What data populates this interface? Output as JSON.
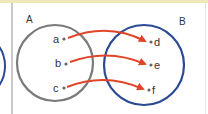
{
  "diagram": {
    "type": "mapping",
    "sets": [
      {
        "name": "A",
        "elements": [
          "a",
          "b",
          "c"
        ],
        "color": "#777777"
      },
      {
        "name": "B",
        "elements": [
          "d",
          "e",
          "f"
        ],
        "color": "#2b4a94"
      }
    ],
    "mappings": [
      {
        "from": "a",
        "to": "d"
      },
      {
        "from": "b",
        "to": "e"
      },
      {
        "from": "c",
        "to": "f"
      }
    ],
    "arrow_color": "#e0452a"
  },
  "labels": {
    "set_a": "A",
    "set_b": "B",
    "a": "a",
    "b": "b",
    "c": "c",
    "d": "d",
    "e": "e",
    "f": "f"
  }
}
